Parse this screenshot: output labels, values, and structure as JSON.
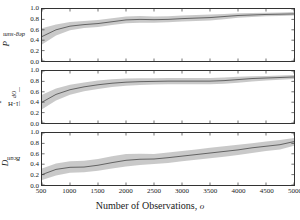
{
  "chart_data": [
    {
      "type": "line",
      "panel_index": 0,
      "ylabel": "P_deg-sum",
      "ylabel_main": "P",
      "ylabel_sub": "deg-sum",
      "xlabel": "",
      "title": "",
      "xlim": [
        500,
        5000
      ],
      "ylim": [
        0.0,
        1.0
      ],
      "yticks": [
        "0.0",
        "0.2",
        "0.4",
        "0.6",
        "0.8",
        "1.0"
      ],
      "ytick_values": [
        0.0,
        0.2,
        0.4,
        0.6,
        0.8,
        1.0
      ],
      "grid": false,
      "legend": "none",
      "line_color": "#4d4d4d",
      "band_color": "#bfbfbf",
      "x": [
        500,
        750,
        1000,
        1250,
        1500,
        1750,
        2000,
        2250,
        2500,
        2750,
        3000,
        3250,
        3500,
        3750,
        4000,
        4250,
        4500,
        4750,
        5000
      ],
      "series": [
        {
          "name": "mean",
          "values": [
            0.47,
            0.6,
            0.67,
            0.7,
            0.72,
            0.755,
            0.79,
            0.8,
            0.795,
            0.8,
            0.815,
            0.825,
            0.835,
            0.855,
            0.875,
            0.885,
            0.895,
            0.9,
            0.905
          ]
        },
        {
          "name": "upper",
          "values": [
            0.63,
            0.7,
            0.75,
            0.77,
            0.79,
            0.82,
            0.855,
            0.865,
            0.855,
            0.86,
            0.875,
            0.885,
            0.895,
            0.905,
            0.92,
            0.925,
            0.93,
            0.935,
            0.94
          ]
        },
        {
          "name": "lower",
          "values": [
            0.315,
            0.49,
            0.59,
            0.635,
            0.655,
            0.69,
            0.725,
            0.735,
            0.735,
            0.745,
            0.76,
            0.77,
            0.78,
            0.805,
            0.83,
            0.845,
            0.86,
            0.865,
            0.875
          ]
        }
      ]
    },
    {
      "type": "line",
      "panel_index": 1,
      "ylabel": "P_|1-HOP|",
      "ylabel_main": "P",
      "ylabel_sub": "|1-HOP|",
      "xlabel": "",
      "title": "",
      "xlim": [
        500,
        5000
      ],
      "ylim": [
        0.0,
        1.0
      ],
      "yticks": [
        "0.0",
        "0.2",
        "0.4",
        "0.6",
        "0.8",
        "1.0"
      ],
      "ytick_values": [
        0.0,
        0.2,
        0.4,
        0.6,
        0.8,
        1.0
      ],
      "grid": false,
      "legend": "none",
      "line_color": "#4d4d4d",
      "band_color": "#bfbfbf",
      "x": [
        500,
        750,
        1000,
        1250,
        1500,
        1750,
        2000,
        2250,
        2500,
        2750,
        3000,
        3250,
        3500,
        3750,
        4000,
        4250,
        4500,
        4750,
        5000
      ],
      "series": [
        {
          "name": "mean",
          "values": [
            0.4,
            0.55,
            0.64,
            0.695,
            0.735,
            0.765,
            0.785,
            0.795,
            0.8,
            0.805,
            0.805,
            0.805,
            0.805,
            0.815,
            0.835,
            0.855,
            0.865,
            0.875,
            0.885
          ]
        },
        {
          "name": "upper",
          "values": [
            0.545,
            0.665,
            0.735,
            0.78,
            0.815,
            0.84,
            0.855,
            0.86,
            0.86,
            0.865,
            0.865,
            0.865,
            0.865,
            0.875,
            0.89,
            0.9,
            0.905,
            0.915,
            0.925
          ]
        },
        {
          "name": "lower",
          "values": [
            0.265,
            0.435,
            0.545,
            0.61,
            0.655,
            0.69,
            0.715,
            0.73,
            0.74,
            0.745,
            0.745,
            0.745,
            0.745,
            0.755,
            0.775,
            0.8,
            0.815,
            0.83,
            0.845
          ]
        }
      ]
    },
    {
      "type": "line",
      "panel_index": 2,
      "ylabel": "D_Bcan",
      "ylabel_main": "D",
      "ylabel_sub": "Bcan",
      "xlabel": "Number of Observations, o",
      "title": "",
      "xlim": [
        500,
        5000
      ],
      "ylim": [
        0.0,
        1.0
      ],
      "yticks": [
        "0.0",
        "0.2",
        "0.4",
        "0.6",
        "0.8",
        "1.0"
      ],
      "ytick_values": [
        0.0,
        0.2,
        0.4,
        0.6,
        0.8,
        1.0
      ],
      "xticks": [
        "500",
        "1000",
        "1500",
        "2000",
        "2500",
        "3000",
        "3500",
        "4000",
        "4500",
        "5000"
      ],
      "xtick_values": [
        500,
        1000,
        1500,
        2000,
        2500,
        3000,
        3500,
        4000,
        4500,
        5000
      ],
      "grid": false,
      "legend": "none",
      "line_color": "#4d4d4d",
      "band_color": "#bfbfbf",
      "x": [
        500,
        750,
        1000,
        1250,
        1500,
        1750,
        2000,
        2250,
        2500,
        2750,
        3000,
        3250,
        3500,
        3750,
        4000,
        4250,
        4500,
        4750,
        5000
      ],
      "series": [
        {
          "name": "mean",
          "values": [
            0.2,
            0.3,
            0.34,
            0.345,
            0.38,
            0.43,
            0.475,
            0.495,
            0.5,
            0.525,
            0.555,
            0.585,
            0.615,
            0.645,
            0.675,
            0.715,
            0.745,
            0.775,
            0.835
          ]
        },
        {
          "name": "upper",
          "values": [
            0.315,
            0.415,
            0.455,
            0.465,
            0.5,
            0.555,
            0.595,
            0.6,
            0.595,
            0.625,
            0.655,
            0.685,
            0.715,
            0.745,
            0.775,
            0.805,
            0.835,
            0.865,
            0.905
          ]
        },
        {
          "name": "lower",
          "values": [
            0.095,
            0.185,
            0.235,
            0.245,
            0.275,
            0.315,
            0.355,
            0.385,
            0.405,
            0.425,
            0.455,
            0.485,
            0.515,
            0.545,
            0.575,
            0.615,
            0.655,
            0.685,
            0.755
          ]
        }
      ]
    }
  ],
  "axis": {
    "xlabel_text": "Number of Observations, ",
    "xlabel_symbol": "o",
    "xticks": [
      "500",
      "1000",
      "1500",
      "2000",
      "2500",
      "3000",
      "3500",
      "4000",
      "4500",
      "5000"
    ]
  }
}
